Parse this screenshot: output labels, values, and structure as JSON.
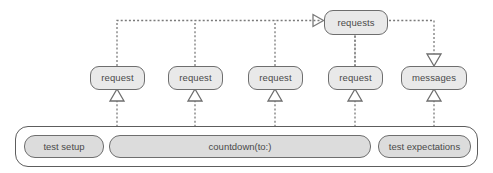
{
  "diagram": {
    "type": "sequence-call-graph",
    "colors": {
      "node_fill": "#e9e9e9",
      "node_border": "#6e6e6e",
      "activation_fill": "#dcdcdc",
      "container_fill": "#ffffff",
      "container_border": "#5d5d5d",
      "edge": "#7a7a7a",
      "text": "#4a4a4a"
    },
    "top_node": {
      "label": "requests",
      "name": "requests-node"
    },
    "middle_nodes": [
      {
        "label": "request",
        "name": "request-node-1"
      },
      {
        "label": "request",
        "name": "request-node-2"
      },
      {
        "label": "request",
        "name": "request-node-3"
      },
      {
        "label": "request",
        "name": "request-node-4"
      },
      {
        "label": "messages",
        "name": "messages-node"
      }
    ],
    "lifeline": {
      "name": "test-lifeline",
      "activations": [
        {
          "label": "test setup",
          "name": "activation-test-setup"
        },
        {
          "label": "countdown(to:)",
          "name": "activation-countdown"
        },
        {
          "label": "test expectations",
          "name": "activation-test-expectations"
        }
      ]
    },
    "edges": [
      {
        "name": "edge-request-1-to-requests",
        "style": "dashed",
        "arrow": "open"
      },
      {
        "name": "edge-request-2-to-requests",
        "style": "dashed",
        "arrow": "open"
      },
      {
        "name": "edge-request-3-to-requests",
        "style": "dashed",
        "arrow": "open"
      },
      {
        "name": "edge-request-4-to-requests",
        "style": "dashed",
        "arrow": "open"
      },
      {
        "name": "edge-requests-to-messages",
        "style": "dashed",
        "arrow": "open"
      },
      {
        "name": "edge-countdown-to-request-1",
        "style": "dashed",
        "arrow": "hollow-triangle"
      },
      {
        "name": "edge-countdown-to-request-2",
        "style": "dashed",
        "arrow": "hollow-triangle"
      },
      {
        "name": "edge-countdown-to-request-3",
        "style": "dashed",
        "arrow": "hollow-triangle"
      },
      {
        "name": "edge-countdown-to-request-4",
        "style": "dashed",
        "arrow": "hollow-triangle"
      },
      {
        "name": "edge-expectations-to-messages",
        "style": "dashed",
        "arrow": "hollow-triangle"
      }
    ]
  }
}
